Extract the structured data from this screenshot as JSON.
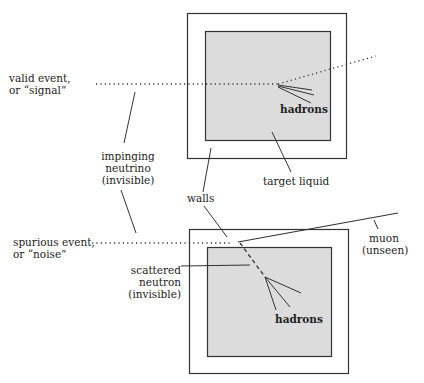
{
  "diagram": {
    "type": "neutrino-detector-schematic",
    "colors": {
      "line": "#333333",
      "liquid_fill": "#dcdcdc",
      "wall_fill": "#ffffff"
    },
    "labels": {
      "valid_event_1": "valid event,",
      "valid_event_2": "or “signal”",
      "impinging_1": "impinging",
      "impinging_2": "neutrino",
      "impinging_3": "(invisible)",
      "walls": "walls",
      "target_liquid": "target liquid",
      "hadrons_top": "hadrons",
      "spurious_1": "spurious event,",
      "spurious_2": "or “noise”",
      "scattered_1": "scattered",
      "scattered_2": "neutron",
      "scattered_3": "(invisible)",
      "muon_1": "muon",
      "muon_2": "(unseen)",
      "hadrons_bottom": "hadrons"
    }
  }
}
